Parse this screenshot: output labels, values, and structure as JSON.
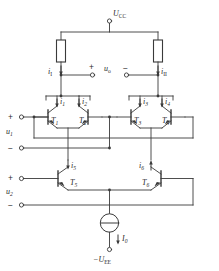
{
  "figure": {
    "kind": "circuit-schematic",
    "stroke_color": "#3a3a3a",
    "text_color": "#2b2b2b",
    "background": "#ffffff"
  },
  "supplies": {
    "positive": {
      "symbol": "U",
      "subscript": "CC",
      "terminal": "circle"
    },
    "negative": {
      "symbol": "−U",
      "subscript": "EE",
      "terminal": "circle"
    }
  },
  "output": {
    "label": "u",
    "label_subscript": "o",
    "plus_sign": "+",
    "minus_sign": "−"
  },
  "inputs": [
    {
      "label": "u",
      "subscript": "1",
      "plus_sign": "+",
      "minus_sign": "−"
    },
    {
      "label": "u",
      "subscript": "2",
      "plus_sign": "+",
      "minus_sign": "−"
    }
  ],
  "currents": [
    {
      "name": "i",
      "subscript": "I",
      "roman_sub": true,
      "direction": "down"
    },
    {
      "name": "i",
      "subscript": "II",
      "roman_sub": true,
      "direction": "down"
    },
    {
      "name": "i",
      "subscript": "1",
      "roman_sub": false,
      "direction": "down"
    },
    {
      "name": "i",
      "subscript": "2",
      "roman_sub": false,
      "direction": "down"
    },
    {
      "name": "i",
      "subscript": "3",
      "roman_sub": false,
      "direction": "down"
    },
    {
      "name": "i",
      "subscript": "4",
      "roman_sub": false,
      "direction": "down"
    },
    {
      "name": "i",
      "subscript": "5",
      "roman_sub": false,
      "direction": "down"
    },
    {
      "name": "i",
      "subscript": "6",
      "roman_sub": false,
      "direction": "up"
    },
    {
      "name": "I",
      "subscript": "0",
      "roman_sub": false,
      "direction": "down"
    }
  ],
  "transistors": [
    {
      "label": "T",
      "subscript": "1",
      "orientation": "npn-left"
    },
    {
      "label": "T",
      "subscript": "2",
      "orientation": "npn-right"
    },
    {
      "label": "T",
      "subscript": "3",
      "orientation": "npn-left"
    },
    {
      "label": "T",
      "subscript": "4",
      "orientation": "npn-right"
    },
    {
      "label": "T",
      "subscript": "5",
      "orientation": "npn-left"
    },
    {
      "label": "T",
      "subscript": "6",
      "orientation": "npn-right"
    }
  ],
  "resistors": [
    {
      "name": "collector-resistor-left"
    },
    {
      "name": "collector-resistor-right"
    }
  ],
  "current_source": {
    "name": "tail-current-source",
    "symbol": "circle-with-bar"
  }
}
